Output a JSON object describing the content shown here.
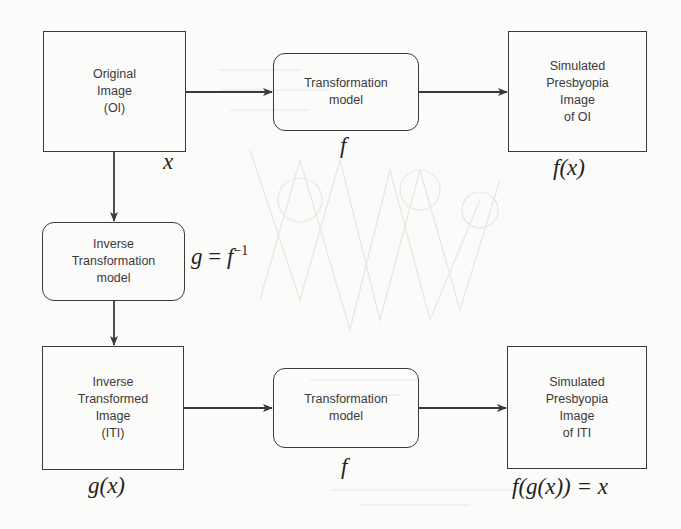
{
  "diagram": {
    "nodes": {
      "original_image": {
        "label": "Original\nImage\n(OI)",
        "math": "x"
      },
      "transformation_model_top": {
        "label": "Transformation\nmodel",
        "math": "f"
      },
      "simulated_oi": {
        "label": "Simulated\nPresbyopia\nImage\nof OI",
        "math": "f(x)"
      },
      "inverse_transformation_model": {
        "label": "Inverse\nTransformation\nmodel",
        "math_lhs": "g",
        "math_eq": "=",
        "math_f": "f",
        "math_sup": "−1"
      },
      "inverse_transformed_image": {
        "label": "Inverse\nTransformed\nImage\n(ITI)",
        "math": "g(x)"
      },
      "transformation_model_bottom": {
        "label": "Transformation\nmodel",
        "math": "f"
      },
      "simulated_iti": {
        "label": "Simulated\nPresbyopia\nImage\nof ITI",
        "math": "f(g(x)) = x"
      }
    },
    "edges": [
      {
        "from": "original_image",
        "to": "transformation_model_top"
      },
      {
        "from": "transformation_model_top",
        "to": "simulated_oi"
      },
      {
        "from": "original_image",
        "to": "inverse_transformation_model"
      },
      {
        "from": "inverse_transformation_model",
        "to": "inverse_transformed_image"
      },
      {
        "from": "inverse_transformed_image",
        "to": "transformation_model_bottom"
      },
      {
        "from": "transformation_model_bottom",
        "to": "simulated_iti"
      }
    ],
    "colors": {
      "stroke": "#3a3a3a",
      "background": "#fbfbfa"
    }
  }
}
